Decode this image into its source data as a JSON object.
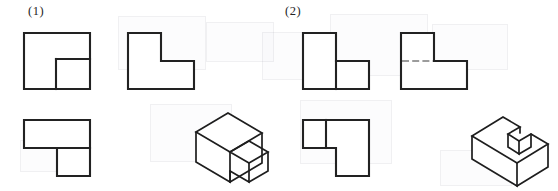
{
  "page": {
    "background_color": "#ffffff",
    "line_color": "#222222",
    "width": 558,
    "height": 191
  },
  "groups": [
    {
      "id": "group-1",
      "caption": "(1)",
      "caption_position": {
        "x": 28,
        "y": 4
      },
      "views": {
        "front_view": {
          "name": "front-view",
          "description": "Large square with a smaller square adjoining at lower right",
          "outline": "24,33 90,33 90,89 24,89",
          "interior_lines": [
            "56,59 90,59",
            "56,59 56,89"
          ]
        },
        "side_view": {
          "name": "side-view",
          "description": "L-shaped profile, tall on left with step down to the right",
          "outline": "128,33 161,33 161,61 194,61 194,89 128,89"
        },
        "top_view": {
          "name": "top-view",
          "description": "L-shape, wide rectangle on top with square below its right portion",
          "outline": "24,120 90,120 90,176 57,176 57,148 24,148",
          "interior_lines": [
            "57,148 90,148"
          ]
        },
        "isometric_view": {
          "name": "isometric-view",
          "description": "Tall rectangular block with smaller cube attached at front right"
        }
      }
    },
    {
      "id": "group-2",
      "caption": "(2)",
      "caption_position": {
        "x": 285,
        "y": 4
      },
      "views": {
        "front_view": {
          "name": "front-view",
          "description": "Stepped block, tall left portion with lower right portion divided by a vertical line",
          "outline": "303,33 336,33 336,61 369,61 369,89 303,89",
          "interior_lines": [
            "336,61 336,89"
          ]
        },
        "side_view": {
          "name": "side-view",
          "description": "Stepped profile with hidden (dashed) line indicating concealed edge",
          "outline": "401,33 434,33 434,61 467,61 467,89 401,89",
          "hidden_lines": [
            "401,61 434,61"
          ]
        },
        "top_view": {
          "name": "top-view",
          "description": "L-shape with vertical dividing line near the left side",
          "outline": "303,120 369,120 369,176 336,176 336,148 303,148",
          "interior_lines": [
            "326,120 326,148"
          ]
        },
        "isometric_view": {
          "name": "isometric-view",
          "description": "Rectangular block with a rectangular notch cut from the top middle"
        }
      }
    }
  ]
}
